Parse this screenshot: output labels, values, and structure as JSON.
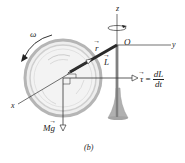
{
  "figure": {
    "caption": "(b)"
  },
  "axes": {
    "x_label": "x",
    "y_label": "y",
    "z_label": "z",
    "origin_label": "O"
  },
  "vectors": {
    "r_label": "r",
    "L_label": "L",
    "torque_label": "τ",
    "torque_eq_sign": "=",
    "torque_numerator": "dL",
    "torque_denominator": "dt",
    "weight_label_prefix": "M",
    "weight_label_vec": "g"
  },
  "angular": {
    "omega_label": "ω"
  },
  "colors": {
    "line": "#333333",
    "wheel_rim": "#b5b5b5",
    "wheel_fill": "#ececec",
    "stand": "#a8a8a8",
    "rod": "#2a2a2a"
  }
}
